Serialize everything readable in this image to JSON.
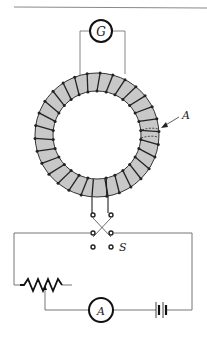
{
  "figure": {
    "labels": {
      "galvanometer": "G",
      "cross_section": "A",
      "switch": "S",
      "ammeter": "A"
    },
    "colors": {
      "line": "#555555",
      "core_fill": "#c8c8c8",
      "winding": "#222222",
      "background": "#ffffff"
    }
  }
}
